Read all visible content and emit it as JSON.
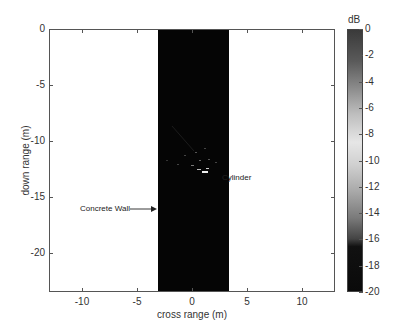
{
  "chart_data": {
    "type": "heatmap",
    "title": "",
    "xlabel": "cross range (m)",
    "ylabel": "down range (m)",
    "xlim": [
      -13,
      13
    ],
    "ylim": [
      0,
      -23.5
    ],
    "xticks": [
      -10,
      -5,
      0,
      5,
      10
    ],
    "xtick_labels": [
      "-10",
      "-5",
      "0",
      "5",
      "10"
    ],
    "yticks": [
      0,
      -5,
      -10,
      -15,
      -20
    ],
    "ytick_labels": [
      "0",
      "-5",
      "-10",
      "-15",
      "-20"
    ],
    "image_extent_x": [
      -3.2,
      3.3
    ],
    "background_level_db": -20,
    "colorbar": {
      "label": "dB",
      "range": [
        -20,
        0
      ],
      "ticks": [
        "0",
        "-2",
        "-4",
        "-6",
        "-8",
        "-10",
        "-12",
        "-14",
        "-16",
        "-18",
        "-20"
      ],
      "colormap": "gray (dark at 0 and -20, light near -9)"
    },
    "annotations": [
      {
        "text": "Cylinder",
        "target_x": 1.0,
        "target_y": -12.5,
        "text_x": 3.5,
        "text_y": -10
      },
      {
        "text": "Concrete Wall",
        "target_x": -3.2,
        "target_y": -7.0,
        "text_x": -10,
        "text_y": -7.0
      }
    ],
    "grid": false,
    "legend": null
  },
  "labels": {
    "xlabel": "cross range (m)",
    "ylabel": "down range (m)",
    "cbar_unit": "dB",
    "cylinder": "Cylinder",
    "wall": "Concrete Wall"
  }
}
